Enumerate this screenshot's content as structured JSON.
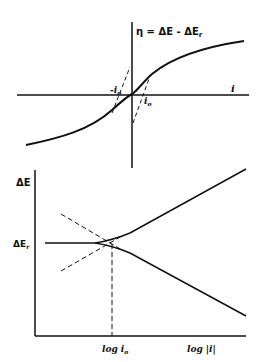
{
  "top_plot": {
    "y_axis_label": "η = ΔE - ΔEr",
    "y_axis_label_main": "η = ΔE - ΔE",
    "y_axis_label_sub": "r",
    "x_axis_label": "i",
    "neg_intercept_label": "-i",
    "neg_intercept_sub": "o",
    "pos_intercept_label": "i",
    "pos_intercept_sub": "o",
    "curve": "sinh-shaped overpotential vs current curve through origin",
    "tangent_lines": "dashed linear tangents near origin intersecting at ±i0"
  },
  "bottom_plot": {
    "y_axis_label": "ΔE",
    "ref_label_main": "ΔE",
    "ref_label_sub": "r",
    "x_tick_label_main": "log i",
    "x_tick_label_sub": "o",
    "x_axis_label": "log |i|",
    "curves": "Tafel plot: horizontal line at ΔEr branching into anodic (up) and cathodic (down) straight lines; dashed Tafel extrapolations intersect at log i0"
  },
  "colors": {
    "line": "#111111",
    "background": "#ffffff"
  }
}
